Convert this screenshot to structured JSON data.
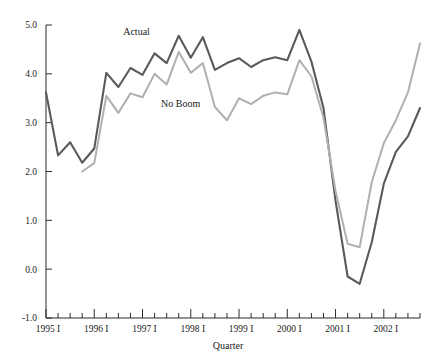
{
  "chart_data": {
    "type": "line",
    "title": "",
    "xlabel": "Quarter",
    "ylabel": "",
    "ylim": [
      -1.0,
      5.0
    ],
    "y_ticks": [
      -1.0,
      0.0,
      1.0,
      2.0,
      3.0,
      4.0,
      5.0
    ],
    "y_tick_labels": [
      "-1.0",
      "0.0",
      "1.0",
      "2.0",
      "3.0",
      "4.0",
      "5.0"
    ],
    "grid": false,
    "legend_position": "inline-annotations",
    "x": [
      "1995 I",
      "1995 II",
      "1995 III",
      "1995 IV",
      "1996 I",
      "1996 II",
      "1996 III",
      "1996 IV",
      "1997 I",
      "1997 II",
      "1997 III",
      "1997 IV",
      "1998 I",
      "1998 II",
      "1998 III",
      "1998 IV",
      "1999 I",
      "1999 II",
      "1999 III",
      "1999 IV",
      "2000 I",
      "2000 II",
      "2000 III",
      "2000 IV",
      "2001 I",
      "2001 II",
      "2001 III",
      "2001 IV",
      "2002 I",
      "2002 II",
      "2002 III",
      "2002 IV"
    ],
    "x_tick_labels": [
      "1995 I",
      "1996 I",
      "1997 I",
      "1998 I",
      "1999 I",
      "2000 I",
      "2001 I",
      "2002 I"
    ],
    "x_tick_label_indices": [
      0,
      4,
      8,
      12,
      16,
      20,
      24,
      28
    ],
    "series": [
      {
        "name": "Actual",
        "color": "#5a5a5a",
        "values": [
          3.62,
          2.33,
          2.6,
          2.18,
          2.47,
          4.02,
          3.73,
          4.12,
          3.98,
          4.42,
          4.22,
          4.78,
          4.33,
          4.75,
          4.08,
          4.22,
          4.32,
          4.14,
          4.28,
          4.34,
          4.28,
          4.9,
          4.25,
          3.3,
          1.4,
          -0.15,
          -0.3,
          0.55,
          1.75,
          2.4,
          2.72,
          3.3
        ]
      },
      {
        "name": "No Boom",
        "color": "#b0b0b0",
        "values": [
          null,
          null,
          null,
          2.0,
          2.17,
          3.55,
          3.2,
          3.6,
          3.52,
          4.0,
          3.78,
          4.45,
          4.02,
          4.22,
          3.32,
          3.05,
          3.5,
          3.38,
          3.55,
          3.62,
          3.58,
          4.28,
          3.95,
          3.1,
          1.6,
          0.52,
          0.45,
          1.78,
          2.58,
          3.05,
          3.62,
          4.62
        ]
      }
    ],
    "annotations": [
      {
        "text": "Actual",
        "x_index": 8,
        "y_value": 4.72,
        "dx": -6,
        "dy": -4
      },
      {
        "text": "No Boom",
        "x_index": 11,
        "y_value": 3.52,
        "dx": 2,
        "dy": 10
      }
    ]
  }
}
